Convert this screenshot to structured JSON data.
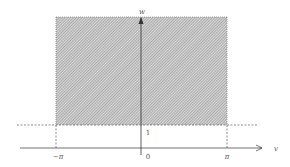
{
  "diagram": {
    "type": "region-plot",
    "axes": {
      "horizontal_label": "v",
      "vertical_label": "w"
    },
    "ticks": {
      "x_neg_pi": "−π",
      "x_zero": "0",
      "x_pi": "π",
      "y_one": "1"
    },
    "region": {
      "v_min": "−π",
      "v_max": "π",
      "w_min": "1",
      "w_max": "unbounded",
      "fill": "hatched"
    },
    "colors": {
      "axis": "#333333",
      "dashed": "#444444",
      "hatch_dark": "#8a8a8a",
      "hatch_light": "#d8d8d8",
      "label": "#555555"
    }
  }
}
